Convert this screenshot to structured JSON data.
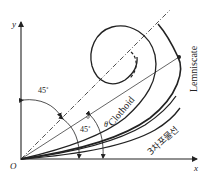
{
  "diagram": {
    "type": "transition-curves",
    "axes": {
      "x_label": "x",
      "y_label": "y",
      "origin_label": "O"
    },
    "angles": {
      "top_angle": "45˚",
      "bottom_angle": "45˚",
      "theta": "θ"
    },
    "curves": {
      "lemniscate": "Lemniscate",
      "clothoid": "Clothoid",
      "cubic_parabola": "3차포물선"
    },
    "colors": {
      "line": "#222222",
      "background": "#ffffff"
    }
  }
}
